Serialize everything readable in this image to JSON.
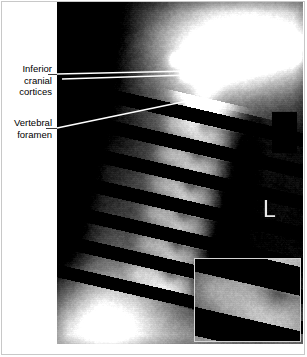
{
  "figure": {
    "type": "radiograph",
    "modality": "X-ray",
    "view": "cervical spine, lateral/oblique projection",
    "background_color": "#ffffff",
    "border_color": "#c8c8c8",
    "width": 307,
    "height": 357
  },
  "annotations": [
    {
      "id": "inferior-cranial-cortices",
      "text": "Inferior\ncranial\ncortices",
      "leader": {
        "x1": 57,
        "y1": 74,
        "x2": 190,
        "y2": 71
      }
    },
    {
      "id": "vertebral-foramen",
      "text": "Vertebral\nforamen",
      "leader": {
        "x1": 57,
        "y1": 128,
        "x2": 192,
        "y2": 100
      }
    }
  ],
  "extra_leader": {
    "x1": 62,
    "y1": 79,
    "x2": 189,
    "y2": 75
  },
  "markers": {
    "laterality": {
      "label": "L",
      "color": "#e9e9e9",
      "x": 263,
      "y": 198
    },
    "redaction_block": {
      "color": "#000000",
      "x": 272,
      "y": 112,
      "width": 25,
      "height": 41
    }
  },
  "inset": {
    "name": "magnified-detail-inset",
    "border_color": "#d5d5d5",
    "x": 194,
    "y": 258,
    "width": 107,
    "height": 84,
    "content": "magnified cervical vertebrae detail"
  },
  "plate": {
    "x": 57,
    "y": 2,
    "width": 246,
    "height": 342,
    "dark_value": "#050505",
    "bright_value": "#f2f2f2"
  }
}
